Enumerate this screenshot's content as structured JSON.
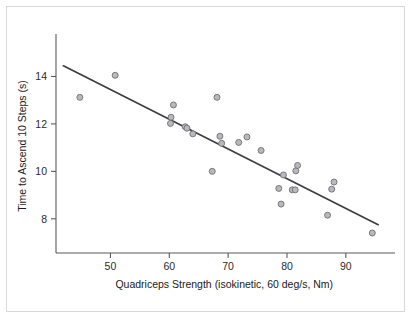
{
  "figure": {
    "background_color": "#ffffff",
    "border_color": "#d8d8d8",
    "marker_fill": "#b9b9bd",
    "marker_stroke": "#6e6e74",
    "line_color": "#3d3d44",
    "axis_color": "#5a5a5a"
  },
  "chart_data": {
    "type": "scatter",
    "title": "",
    "xlabel": "Quadriceps Strength (isokinetic, 60 deg/s, Nm)",
    "ylabel": "Time to Ascend 10 Steps (s)",
    "xlim": [
      41.0,
      97.0
    ],
    "ylim": [
      6.6,
      15.2
    ],
    "xticks": [
      50,
      60,
      70,
      80,
      90
    ],
    "yticks": [
      8,
      10,
      12,
      14
    ],
    "xtick_labels": [
      "50",
      "60",
      "70",
      "80",
      "90"
    ],
    "ytick_labels": [
      "8",
      "10",
      "12",
      "14"
    ],
    "grid": false,
    "legend": null,
    "series": [
      {
        "name": "Subjects",
        "marker": "open-circle",
        "points": [
          {
            "x": 44.8,
            "y": 13.12
          },
          {
            "x": 50.8,
            "y": 14.05
          },
          {
            "x": 60.3,
            "y": 12.28
          },
          {
            "x": 60.2,
            "y": 12.02
          },
          {
            "x": 60.7,
            "y": 12.8
          },
          {
            "x": 62.7,
            "y": 11.88
          },
          {
            "x": 63.0,
            "y": 11.82
          },
          {
            "x": 64.0,
            "y": 11.58
          },
          {
            "x": 67.3,
            "y": 10.0
          },
          {
            "x": 68.1,
            "y": 13.12
          },
          {
            "x": 68.6,
            "y": 11.48
          },
          {
            "x": 68.9,
            "y": 11.18
          },
          {
            "x": 71.8,
            "y": 11.22
          },
          {
            "x": 73.2,
            "y": 11.45
          },
          {
            "x": 75.6,
            "y": 10.88
          },
          {
            "x": 78.6,
            "y": 9.28
          },
          {
            "x": 79.0,
            "y": 8.62
          },
          {
            "x": 79.4,
            "y": 9.85
          },
          {
            "x": 80.9,
            "y": 9.22
          },
          {
            "x": 81.4,
            "y": 9.22
          },
          {
            "x": 81.5,
            "y": 10.02
          },
          {
            "x": 81.8,
            "y": 10.25
          },
          {
            "x": 86.9,
            "y": 8.15
          },
          {
            "x": 87.6,
            "y": 9.25
          },
          {
            "x": 88.0,
            "y": 9.55
          },
          {
            "x": 94.5,
            "y": 7.4
          }
        ]
      }
    ],
    "fit_line": {
      "name": "regression-line",
      "x_start": 42.0,
      "y_start": 14.45,
      "x_end": 95.5,
      "y_end": 7.75
    }
  }
}
